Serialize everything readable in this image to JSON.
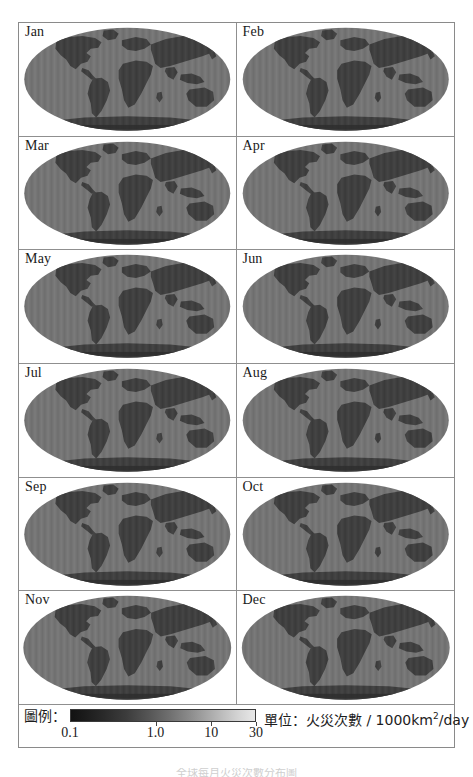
{
  "figure": {
    "type": "map-grid",
    "projection": "Mollweide",
    "rows": 6,
    "columns": 2,
    "panel_count": 12,
    "caption": "全球每月火災次數分布圖"
  },
  "panels": [
    {
      "label": "Jan",
      "month_index": 1
    },
    {
      "label": "Feb",
      "month_index": 2
    },
    {
      "label": "Mar",
      "month_index": 3
    },
    {
      "label": "Apr",
      "month_index": 4
    },
    {
      "label": "May",
      "month_index": 5
    },
    {
      "label": "Jun",
      "month_index": 6
    },
    {
      "label": "Jul",
      "month_index": 7
    },
    {
      "label": "Aug",
      "month_index": 8
    },
    {
      "label": "Sep",
      "month_index": 9
    },
    {
      "label": "Oct",
      "month_index": 10
    },
    {
      "label": "Nov",
      "month_index": 11
    },
    {
      "label": "Dec",
      "month_index": 12
    }
  ],
  "legend": {
    "title": "圖例：",
    "unit_prefix": "單位：火災次數 / 1000km",
    "unit_exponent": "2",
    "unit_suffix": "/day",
    "unit_full": "單位：火災次數 / 1000km2/day",
    "ticks": [
      "0.1",
      "1.0",
      "10",
      "30"
    ],
    "tick_positions_pct": [
      0,
      46,
      76,
      100
    ],
    "scale": "logarithmic",
    "min": "0.1",
    "max": "30",
    "colors": {
      "low": "#121212",
      "mid": "#6e6e6e",
      "high": "#e8e8e8"
    }
  },
  "chart_data": {
    "type": "heatmap",
    "title": "",
    "subtitle": "",
    "xlabel": "",
    "ylabel": "",
    "legend_position": "bottom",
    "grid": false,
    "colorbar": {
      "label": "單位：火災次數 / 1000km2/day",
      "ticks": [
        0.1,
        1.0,
        10,
        30
      ],
      "tick_labels": [
        "0.1",
        "1.0",
        "10",
        "30"
      ],
      "scale": "log",
      "range": [
        0.1,
        30
      ],
      "colormap": "grayscale-reversed"
    },
    "panels": [
      {
        "name": "Jan",
        "ocean_value": 0.9,
        "land_value": 0.15
      },
      {
        "name": "Feb",
        "ocean_value": 0.9,
        "land_value": 0.15
      },
      {
        "name": "Mar",
        "ocean_value": 0.9,
        "land_value": 0.15
      },
      {
        "name": "Apr",
        "ocean_value": 0.9,
        "land_value": 0.15
      },
      {
        "name": "May",
        "ocean_value": 0.9,
        "land_value": 0.15
      },
      {
        "name": "Jun",
        "ocean_value": 0.9,
        "land_value": 0.15
      },
      {
        "name": "Jul",
        "ocean_value": 0.9,
        "land_value": 0.15
      },
      {
        "name": "Aug",
        "ocean_value": 0.9,
        "land_value": 0.15
      },
      {
        "name": "Sep",
        "ocean_value": 0.9,
        "land_value": 0.15
      },
      {
        "name": "Oct",
        "ocean_value": 0.9,
        "land_value": 0.15
      },
      {
        "name": "Nov",
        "ocean_value": 0.9,
        "land_value": 0.15
      },
      {
        "name": "Dec",
        "ocean_value": 0.9,
        "land_value": 0.15
      }
    ]
  }
}
